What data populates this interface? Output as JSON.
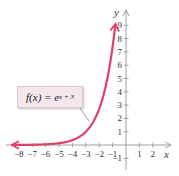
{
  "chart_data": {
    "type": "line",
    "title": "",
    "function_label": "f(x) = e^(x + 3)",
    "label_parts": {
      "lhs": "f(x) = e",
      "exponent": "x + 3"
    },
    "xlabel": "x",
    "ylabel": "y",
    "xlim": [
      -8.5,
      3
    ],
    "ylim": [
      -1.5,
      10
    ],
    "x_ticks": [
      -8,
      -7,
      -6,
      -5,
      -4,
      -3,
      -2,
      -1,
      1,
      2
    ],
    "y_ticks": [
      -1,
      1,
      2,
      3,
      4,
      5,
      6,
      7,
      8,
      9
    ],
    "grid": false,
    "series": [
      {
        "name": "f(x) = e^(x+3)",
        "color": "#e0406a",
        "x": [
          -8.5,
          -8,
          -7,
          -6,
          -5,
          -4,
          -3,
          -2.5,
          -2,
          -1.5,
          -1,
          -0.8
        ],
        "values": [
          0.004,
          0.007,
          0.018,
          0.05,
          0.135,
          0.368,
          1.0,
          1.65,
          2.72,
          4.48,
          7.39,
          9.03
        ]
      }
    ],
    "annotations": [
      "asymptote arrow toward y=0 on left",
      "arrow upward at top of curve"
    ]
  },
  "colors": {
    "curve": "#e0406a",
    "axis": "#888888",
    "box_bg": "#f3e6ec"
  }
}
